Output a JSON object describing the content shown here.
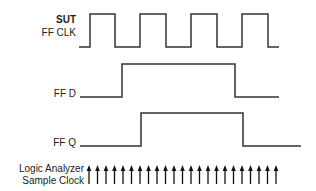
{
  "labels": {
    "title": "SUT",
    "clk": "FF CLK",
    "d": "FF D",
    "q": "FF Q",
    "analyzer_line1": "Logic Analyzer",
    "analyzer_line2": "Sample Clock"
  },
  "colors": {
    "line": "#333333",
    "arrow": "#111111"
  },
  "signals": {
    "clk": {
      "points": "79,47 90,47 90,14 115,14 115,47 140,47 140,14 166,14 166,47 191,47 191,14 217,14 217,47 242,47 242,14 268,14 268,47 279,47"
    },
    "d": {
      "points": "80,97 122,97 122,64 235,64 235,97 279,97"
    },
    "q": {
      "points": "80,146 141,146 141,113 243,113 243,146 301,146"
    }
  },
  "sample_clock": {
    "count": 23,
    "start_x": 89,
    "spacing": 8.5,
    "top_y": 165,
    "bottom_y": 184
  }
}
